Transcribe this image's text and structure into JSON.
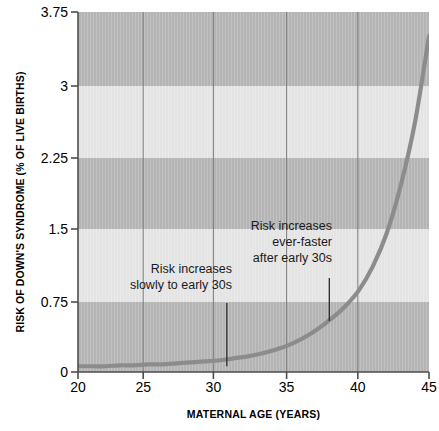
{
  "chart_data": {
    "type": "line",
    "title": "",
    "xlabel": "MATERNAL AGE (YEARS)",
    "ylabel": "RISK OF DOWN'S SYNDROME (% OF LIVE BIRTHS)",
    "xlim": [
      20,
      45
    ],
    "ylim": [
      0,
      3.75
    ],
    "xticks": [
      20,
      25,
      30,
      35,
      40,
      45
    ],
    "xtick_labels": [
      "20",
      "25",
      "30",
      "35",
      "40",
      "45"
    ],
    "yticks": [
      0,
      0.75,
      1.5,
      2.25,
      3,
      3.75
    ],
    "ytick_labels": [
      "0",
      "0.75",
      "1.5",
      "2.25",
      "3",
      "3.75"
    ],
    "grid": "vertical gridlines at each x tick; horizontal alternating shaded bands every 0.75 units",
    "legend": "none",
    "series": [
      {
        "name": "Risk of Down's syndrome",
        "x": [
          20,
          21,
          22,
          23,
          24,
          25,
          26,
          27,
          28,
          29,
          30,
          31,
          32,
          33,
          34,
          35,
          36,
          37,
          38,
          39,
          40,
          41,
          42,
          43,
          44,
          45
        ],
        "values": [
          0.06,
          0.06,
          0.06,
          0.07,
          0.07,
          0.08,
          0.08,
          0.09,
          0.1,
          0.11,
          0.12,
          0.14,
          0.16,
          0.19,
          0.23,
          0.28,
          0.35,
          0.44,
          0.55,
          0.68,
          0.85,
          1.1,
          1.45,
          1.95,
          2.6,
          3.5
        ],
        "color": "#8c8c8c"
      }
    ],
    "annotations": [
      {
        "text": "Risk increases\nslowly to early 30s",
        "pointer_x": 30.6,
        "pointer_y_top": 0.72,
        "pointer_y_bottom": 0.06
      },
      {
        "text": "Risk increases\never-faster\nafter early 30s",
        "pointer_x": 37.9,
        "pointer_y_top": 0.98,
        "pointer_y_bottom": 0.53
      }
    ],
    "colors": {
      "band_dark": "#b4b4b4",
      "band_light": "#e4e4e4",
      "gridline": "#8a8a8a",
      "axis": "#4d4d4d",
      "curve": "#8c8c8c",
      "text": "#000000",
      "annotation_text": "#1a1a1a",
      "background": "#ffffff"
    }
  }
}
